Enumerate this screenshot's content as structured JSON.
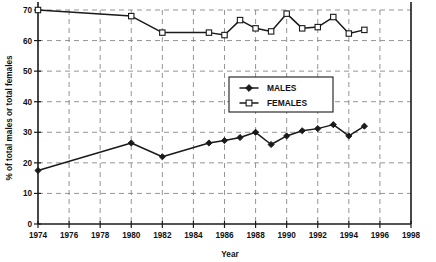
{
  "chart_data": {
    "type": "line",
    "title": "",
    "xlabel": "Year",
    "ylabel": "% of total males or total females",
    "xlim": [
      1974,
      1998
    ],
    "ylim": [
      0,
      70
    ],
    "grid": true,
    "legend_position": "center",
    "x_ticks": [
      1974,
      1976,
      1978,
      1980,
      1982,
      1984,
      1986,
      1988,
      1990,
      1992,
      1994,
      1996,
      1998
    ],
    "x_tick_labels": [
      "1974",
      "1976",
      "1978",
      "1980",
      "1982",
      "1984",
      "1986",
      "1988",
      "1990",
      "1992",
      "1994",
      "1996",
      "1998"
    ],
    "y_ticks": [
      0,
      10,
      20,
      30,
      40,
      50,
      60,
      70
    ],
    "y_tick_labels": [
      "0",
      "10",
      "20",
      "30",
      "40",
      "50",
      "60",
      "70"
    ],
    "x": [
      1974,
      1980,
      1982,
      1985,
      1986,
      1987,
      1988,
      1989,
      1990,
      1991,
      1992,
      1993,
      1994,
      1995,
      1996,
      1997
    ],
    "series": [
      {
        "name": "MALES",
        "marker": "filled-diamond",
        "values": [
          17.5,
          26.5,
          22.0,
          26.5,
          27.3,
          28.3,
          30.0,
          26.0,
          28.8,
          30.5,
          31.2,
          32.5,
          28.8,
          32.0,
          null,
          null
        ]
      },
      {
        "name": "FEMALES",
        "marker": "open-square",
        "values": [
          70.0,
          68.0,
          62.6,
          62.6,
          61.8,
          66.7,
          64.0,
          63.0,
          68.8,
          64.0,
          64.4,
          67.7,
          62.3,
          63.5,
          null,
          null
        ]
      }
    ],
    "series_x_males": [
      1974,
      1980,
      1982,
      1985,
      1986,
      1987,
      1988,
      1989,
      1990,
      1991,
      1992,
      1993,
      1994,
      1995,
      1996,
      1997
    ],
    "series_values_males": [
      17.5,
      26.5,
      22.0,
      26.5,
      27.3,
      28.3,
      30.0,
      26.0,
      28.8,
      30.5,
      31.2,
      32.5,
      28.8,
      32.0
    ],
    "series_x_females": [
      1974,
      1980,
      1982,
      1985,
      1986,
      1987,
      1988,
      1989,
      1990,
      1991,
      1992,
      1993,
      1994,
      1995
    ],
    "series_values_females": [
      70.0,
      68.0,
      62.6,
      62.6,
      61.8,
      66.7,
      64.0,
      63.0,
      68.8,
      64.0,
      64.4,
      67.7,
      62.3,
      63.5
    ]
  },
  "legend": {
    "males_label": "MALES",
    "females_label": "FEMALES"
  },
  "colors": {
    "line": "#1a1a1a",
    "grid": "#7a7a7a",
    "background": "#ffffff"
  }
}
